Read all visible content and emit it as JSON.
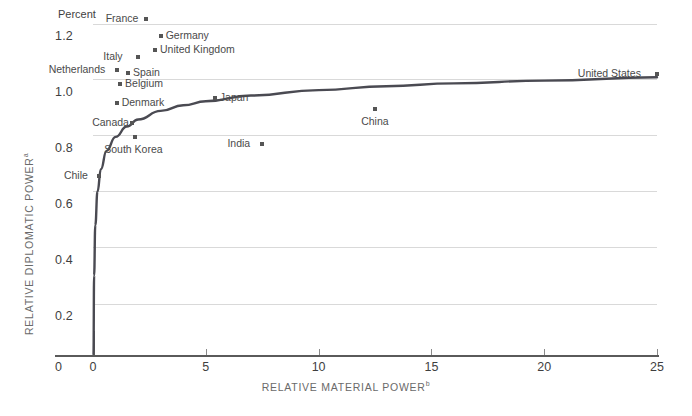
{
  "chart_data": {
    "type": "scatter",
    "title": "",
    "xlabel": "RELATIVE MATERIAL POWER",
    "xlabel_superscript": "b",
    "ylabel": "RELATIVE DIPLOMATIC POWER",
    "ylabel_superscript": "a",
    "unit_note": "Percent",
    "xlim": [
      0,
      25
    ],
    "ylim": [
      0,
      1.3
    ],
    "xticks": [
      0,
      5,
      10,
      15,
      20,
      25
    ],
    "xtick_labels": [
      "0",
      "5",
      "10",
      "15",
      "20",
      "25"
    ],
    "yticks": [
      0.2,
      0.4,
      0.6,
      0.8,
      1.0,
      1.2
    ],
    "ytick_labels": [
      "0.2",
      "0.4",
      "0.6",
      "0.8",
      "1.0",
      "1.2"
    ],
    "y_origin_label": "0",
    "grid": "horizontal",
    "legend": "none",
    "points": [
      {
        "name": "France",
        "x": 2.35,
        "y": 1.215,
        "label_side": "left"
      },
      {
        "name": "Germany",
        "x": 3.0,
        "y": 1.155,
        "label_side": "right"
      },
      {
        "name": "United Kingdom",
        "x": 2.75,
        "y": 1.105,
        "label_side": "right"
      },
      {
        "name": "Italy",
        "x": 2.0,
        "y": 1.08,
        "label_side": "left"
      },
      {
        "name": "Netherlands",
        "x": 1.05,
        "y": 1.035,
        "label_side": "left"
      },
      {
        "name": "Spain",
        "x": 1.55,
        "y": 1.025,
        "label_side": "right"
      },
      {
        "name": "Belgium",
        "x": 1.2,
        "y": 0.985,
        "label_side": "right"
      },
      {
        "name": "Denmark",
        "x": 1.05,
        "y": 0.915,
        "label_side": "right"
      },
      {
        "name": "Canada",
        "x": 1.75,
        "y": 0.845,
        "label_side": "left"
      },
      {
        "name": "South Korea",
        "x": 1.85,
        "y": 0.795,
        "label_side": "below"
      },
      {
        "name": "Japan",
        "x": 5.4,
        "y": 0.935,
        "label_side": "right"
      },
      {
        "name": "China",
        "x": 12.5,
        "y": 0.895,
        "label_side": "below"
      },
      {
        "name": "India",
        "x": 7.5,
        "y": 0.77,
        "label_side": "left"
      },
      {
        "name": "Chile",
        "x": 0.25,
        "y": 0.655,
        "label_side": "left"
      },
      {
        "name": "United States",
        "x": 25.0,
        "y": 1.02,
        "label_side": "left"
      }
    ],
    "fit_curve": {
      "description": "Logarithmic best-fit trend line of diplomatic power vs material power",
      "points": [
        {
          "x": 0.02,
          "y": 0.02
        },
        {
          "x": 0.05,
          "y": 0.3
        },
        {
          "x": 0.1,
          "y": 0.48
        },
        {
          "x": 0.2,
          "y": 0.6
        },
        {
          "x": 0.35,
          "y": 0.68
        },
        {
          "x": 0.6,
          "y": 0.745
        },
        {
          "x": 1.0,
          "y": 0.795
        },
        {
          "x": 1.5,
          "y": 0.832
        },
        {
          "x": 2.0,
          "y": 0.857
        },
        {
          "x": 3.0,
          "y": 0.888
        },
        {
          "x": 4.0,
          "y": 0.908
        },
        {
          "x": 5.0,
          "y": 0.922
        },
        {
          "x": 7.0,
          "y": 0.943
        },
        {
          "x": 10.0,
          "y": 0.962
        },
        {
          "x": 13.0,
          "y": 0.976
        },
        {
          "x": 16.0,
          "y": 0.986
        },
        {
          "x": 20.0,
          "y": 0.996
        },
        {
          "x": 25.0,
          "y": 1.008
        }
      ]
    }
  }
}
